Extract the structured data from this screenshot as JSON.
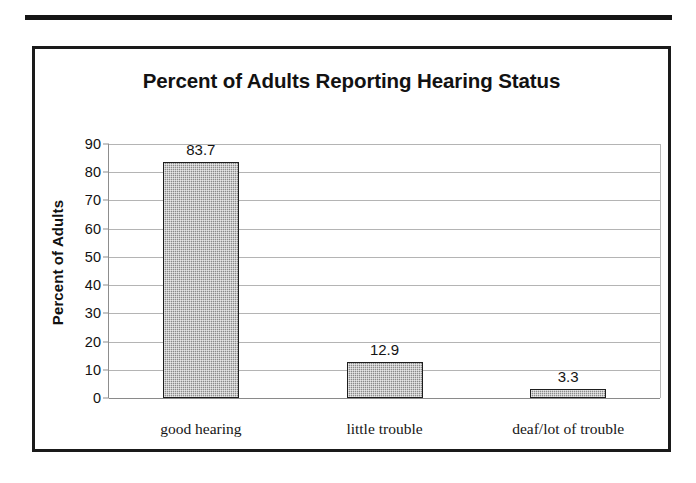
{
  "document": {
    "top_rule": "horizontal-rule",
    "frame": "chart-border"
  },
  "chart_data": {
    "type": "bar",
    "title": "Percent of Adults Reporting Hearing Status",
    "xlabel": "",
    "ylabel": "Percent of Adults",
    "categories": [
      "good hearing",
      "little trouble",
      "deaf/lot of trouble"
    ],
    "values": [
      83.7,
      12.9,
      3.3
    ],
    "value_labels": [
      "83.7",
      "12.9",
      "3.3"
    ],
    "ylim": [
      0,
      90
    ],
    "yticks": [
      0,
      10,
      20,
      30,
      40,
      50,
      60,
      70,
      80,
      90
    ],
    "ytick_labels": [
      "0",
      "10",
      "20",
      "30",
      "40",
      "50",
      "60",
      "70",
      "80",
      "90"
    ],
    "grid": true,
    "legend": false,
    "legend_position": "none",
    "bar_fill_color": "#8a8a8a",
    "bar_border_color": "#1e1e1e",
    "gridline_color": "#b4b4b4",
    "text_color": "#111111",
    "background_color": "#ffffff"
  }
}
